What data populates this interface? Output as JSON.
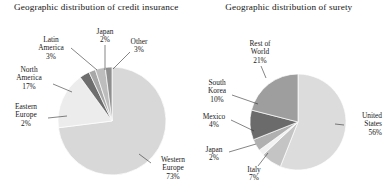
{
  "figure": {
    "background": "#ffffff",
    "panels": [
      {
        "id": "credit-insurance",
        "title": "Geographic distribution of credit insurance"
      },
      {
        "id": "surety",
        "title": "Geographic distribution of surety"
      }
    ]
  },
  "labels": {
    "left": {
      "latin_america": "Latin\nAmerica",
      "latin_america_name": "Latin",
      "latin_america_name2": "America",
      "latin_america_pct": "3%",
      "japan_name": "Japan",
      "japan_pct": "2%",
      "other_name": "Other",
      "other_pct": "3%",
      "north_america_name": "North",
      "north_america_name2": "America",
      "north_america_pct": "17%",
      "eastern_europe_name": "Eastern",
      "eastern_europe_name2": "Europe",
      "eastern_europe_pct": "2%",
      "western_europe_name": "Western",
      "western_europe_name2": "Europe",
      "western_europe_pct": "73%"
    },
    "right": {
      "rest_of_world_name": "Rest of",
      "rest_of_world_name2": "World",
      "rest_of_world_pct": "21%",
      "south_korea_name": "South",
      "south_korea_name2": "Korea",
      "south_korea_pct": "10%",
      "mexico_name": "Mexico",
      "mexico_pct": "4%",
      "japan_name": "Japan",
      "japan_pct": "2%",
      "italy_name": "Italy",
      "italy_pct": "7%",
      "united_states_name": "United",
      "united_states_name2": "States",
      "united_states_pct": "56%"
    }
  },
  "chart_data": [
    {
      "type": "pie",
      "title": "Geographic distribution of credit insurance",
      "xlabel": "",
      "ylabel": "",
      "legend_position": "none",
      "grid": false,
      "units": "percent",
      "categories": [
        "Western Europe",
        "North America",
        "Latin America",
        "Japan",
        "Other",
        "Eastern Europe"
      ],
      "values": [
        73,
        17,
        3,
        2,
        3,
        2
      ],
      "slices": [
        {
          "label": "Western Europe",
          "value": 73,
          "color": "#d8d8d8"
        },
        {
          "label": "North America",
          "value": 17,
          "color": "#ececec"
        },
        {
          "label": "Latin America",
          "value": 3,
          "color": "#6e6e6e"
        },
        {
          "label": "Japan",
          "value": 2,
          "color": "#a8a8a8"
        },
        {
          "label": "Other",
          "value": 3,
          "color": "#bdbdbd"
        },
        {
          "label": "Eastern Europe",
          "value": 2,
          "color": "#8f8f8f"
        }
      ],
      "center": [
        112,
        121
      ],
      "radius": 54,
      "start_angle_deg": -90
    },
    {
      "type": "pie",
      "title": "Geographic distribution of surety",
      "xlabel": "",
      "ylabel": "",
      "legend_position": "none",
      "grid": false,
      "units": "percent",
      "categories": [
        "United States",
        "Italy",
        "Japan",
        "Mexico",
        "South Korea",
        "Rest of World"
      ],
      "values": [
        56,
        7,
        2,
        4,
        10,
        21
      ],
      "slices": [
        {
          "label": "United States",
          "value": 56,
          "color": "#dcdcdc"
        },
        {
          "label": "Italy",
          "value": 7,
          "color": "#c4c4c4"
        },
        {
          "label": "Japan",
          "value": 2,
          "color": "#f2f2f2"
        },
        {
          "label": "Mexico",
          "value": 4,
          "color": "#b0b0b0"
        },
        {
          "label": "South Korea",
          "value": 10,
          "color": "#6b6b6b"
        },
        {
          "label": "Rest of World",
          "value": 21,
          "color": "#9e9e9e"
        }
      ],
      "center": [
        298,
        122
      ],
      "radius": 48,
      "start_angle_deg": -90
    }
  ]
}
